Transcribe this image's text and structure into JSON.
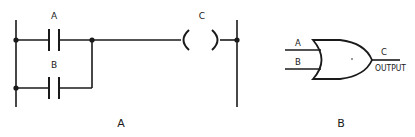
{
  "figure_a": {
    "caption": "A",
    "contact_top_label": "A",
    "contact_bottom_label": "B",
    "coil_label": "C"
  },
  "figure_b": {
    "caption": "B",
    "input_a_label": "A",
    "input_b_label": "B",
    "output_label": "C",
    "output_text": "OUTPUT"
  },
  "colors": {
    "stroke": "#1a1a1a",
    "background": "#ffffff"
  }
}
